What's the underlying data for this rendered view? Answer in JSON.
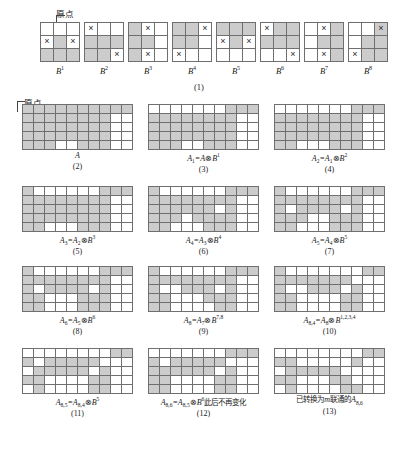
{
  "figure": {
    "origin_label": "原点",
    "section_caption_1": "(1)",
    "palette": {
      "filled": "#cccccc",
      "empty": "#ffffff",
      "border": "#6f6f6f",
      "mark": "#2a2a2a"
    },
    "marker_glyph": "×"
  },
  "structuring_elements": {
    "rows": 3,
    "cols": 3,
    "items": [
      {
        "name": "B",
        "sup": "1",
        "filled": [
          [
            0,
            0,
            0
          ],
          [
            0,
            1,
            0
          ],
          [
            1,
            1,
            1
          ]
        ],
        "marks": [
          [
            0,
            0,
            0
          ],
          [
            1,
            0,
            1
          ],
          [
            0,
            0,
            0
          ]
        ]
      },
      {
        "name": "B",
        "sup": "2",
        "filled": [
          [
            0,
            0,
            0
          ],
          [
            1,
            1,
            1
          ],
          [
            1,
            1,
            0
          ]
        ],
        "marks": [
          [
            1,
            0,
            0
          ],
          [
            0,
            0,
            0
          ],
          [
            0,
            0,
            1
          ]
        ]
      },
      {
        "name": "B",
        "sup": "3",
        "filled": [
          [
            1,
            0,
            0
          ],
          [
            1,
            1,
            0
          ],
          [
            1,
            0,
            0
          ]
        ],
        "marks": [
          [
            0,
            1,
            0
          ],
          [
            0,
            0,
            0
          ],
          [
            0,
            1,
            0
          ]
        ]
      },
      {
        "name": "B",
        "sup": "4",
        "filled": [
          [
            1,
            1,
            0
          ],
          [
            1,
            1,
            0
          ],
          [
            0,
            0,
            0
          ]
        ],
        "marks": [
          [
            0,
            0,
            1
          ],
          [
            0,
            0,
            0
          ],
          [
            1,
            0,
            0
          ]
        ]
      },
      {
        "name": "B",
        "sup": "5",
        "filled": [
          [
            1,
            1,
            1
          ],
          [
            0,
            1,
            0
          ],
          [
            0,
            0,
            0
          ]
        ],
        "marks": [
          [
            0,
            0,
            0
          ],
          [
            1,
            0,
            1
          ],
          [
            0,
            0,
            0
          ]
        ]
      },
      {
        "name": "B",
        "sup": "6",
        "filled": [
          [
            0,
            1,
            1
          ],
          [
            1,
            1,
            1
          ],
          [
            0,
            0,
            0
          ]
        ],
        "marks": [
          [
            1,
            0,
            0
          ],
          [
            0,
            0,
            0
          ],
          [
            0,
            0,
            1
          ]
        ]
      },
      {
        "name": "B",
        "sup": "7",
        "filled": [
          [
            0,
            0,
            1
          ],
          [
            0,
            1,
            1
          ],
          [
            0,
            0,
            1
          ]
        ],
        "marks": [
          [
            0,
            1,
            0
          ],
          [
            0,
            0,
            0
          ],
          [
            0,
            1,
            0
          ]
        ]
      },
      {
        "name": "B",
        "sup": "8",
        "filled": [
          [
            0,
            0,
            1
          ],
          [
            0,
            1,
            1
          ],
          [
            0,
            1,
            1
          ]
        ],
        "marks": [
          [
            0,
            0,
            1
          ],
          [
            0,
            0,
            0
          ],
          [
            1,
            0,
            0
          ]
        ]
      }
    ]
  },
  "matrix_panels": {
    "rows": 5,
    "cols": 10,
    "panels": [
      {
        "id": "A",
        "number": "(2)",
        "caption_html": "A",
        "grid": [
          [
            1,
            1,
            1,
            1,
            1,
            1,
            1,
            1,
            1,
            1
          ],
          [
            1,
            1,
            1,
            1,
            1,
            1,
            1,
            1,
            0,
            0
          ],
          [
            1,
            1,
            1,
            1,
            1,
            1,
            1,
            1,
            0,
            0
          ],
          [
            1,
            1,
            1,
            1,
            1,
            1,
            1,
            1,
            0,
            0
          ],
          [
            1,
            1,
            1,
            0,
            0,
            1,
            1,
            1,
            0,
            0
          ]
        ]
      },
      {
        "id": "A1",
        "number": "(3)",
        "caption_html": "A<sub>1</sub>=A<span class=\"op\">⊗</span>B<sup>1</sup>",
        "grid": [
          [
            0,
            0,
            0,
            0,
            0,
            0,
            0,
            1,
            1,
            1
          ],
          [
            1,
            1,
            1,
            1,
            1,
            1,
            1,
            1,
            0,
            0
          ],
          [
            1,
            1,
            1,
            1,
            1,
            1,
            1,
            1,
            0,
            0
          ],
          [
            1,
            1,
            1,
            1,
            1,
            1,
            1,
            1,
            0,
            0
          ],
          [
            1,
            1,
            1,
            0,
            0,
            1,
            1,
            1,
            0,
            0
          ]
        ]
      },
      {
        "id": "A2",
        "number": "(4)",
        "caption_html": "A<sub>2</sub>=A<sub>1</sub><span class=\"op\">⊗</span>B<sup>2</sup>",
        "grid": [
          [
            0,
            0,
            0,
            0,
            0,
            0,
            0,
            1,
            1,
            1
          ],
          [
            1,
            1,
            1,
            1,
            1,
            1,
            1,
            1,
            0,
            0
          ],
          [
            1,
            1,
            1,
            1,
            1,
            1,
            1,
            1,
            0,
            0
          ],
          [
            1,
            1,
            1,
            1,
            1,
            1,
            1,
            1,
            0,
            0
          ],
          [
            1,
            1,
            0,
            0,
            0,
            1,
            1,
            1,
            0,
            0
          ]
        ]
      },
      {
        "id": "A3",
        "number": "(5)",
        "caption_html": "A<sub>3</sub>=A<sub>2</sub><span class=\"op\">⊗</span>B<sup>3</sup>",
        "grid": [
          [
            1,
            0,
            0,
            0,
            0,
            0,
            0,
            1,
            1,
            1
          ],
          [
            1,
            1,
            1,
            1,
            1,
            1,
            1,
            1,
            0,
            0
          ],
          [
            1,
            1,
            1,
            1,
            1,
            1,
            1,
            1,
            0,
            0
          ],
          [
            1,
            1,
            1,
            1,
            1,
            1,
            1,
            1,
            0,
            0
          ],
          [
            1,
            1,
            0,
            0,
            0,
            1,
            1,
            1,
            0,
            0
          ]
        ]
      },
      {
        "id": "A4",
        "number": "(6)",
        "caption_html": "A<sub>4</sub>=A<sub>3</sub><span class=\"op\">⊗</span>B<sup>4</sup>",
        "grid": [
          [
            1,
            0,
            0,
            0,
            0,
            0,
            0,
            1,
            1,
            1
          ],
          [
            1,
            1,
            1,
            1,
            1,
            1,
            1,
            1,
            0,
            0
          ],
          [
            1,
            1,
            1,
            1,
            1,
            1,
            0,
            1,
            0,
            0
          ],
          [
            1,
            1,
            1,
            0,
            1,
            1,
            1,
            1,
            0,
            0
          ],
          [
            1,
            1,
            0,
            0,
            0,
            1,
            1,
            1,
            0,
            0
          ]
        ]
      },
      {
        "id": "A5",
        "number": "(7)",
        "caption_html": "A<sub>5</sub>=A<sub>4</sub><span class=\"op\">⊗</span>B<sup>5</sup>",
        "grid": [
          [
            1,
            0,
            0,
            0,
            0,
            0,
            0,
            1,
            1,
            1
          ],
          [
            1,
            1,
            1,
            1,
            1,
            1,
            1,
            1,
            0,
            0
          ],
          [
            1,
            0,
            1,
            1,
            1,
            1,
            0,
            1,
            0,
            0
          ],
          [
            1,
            1,
            1,
            0,
            0,
            1,
            1,
            1,
            0,
            0
          ],
          [
            1,
            1,
            0,
            0,
            0,
            1,
            1,
            1,
            0,
            0
          ]
        ]
      },
      {
        "id": "A6",
        "number": "(8)",
        "caption_html": "A<sub>6</sub>=A<sub>5</sub><span class=\"op\">⊗</span>B<sup>6</sup>",
        "grid": [
          [
            1,
            0,
            0,
            0,
            0,
            0,
            0,
            1,
            1,
            1
          ],
          [
            1,
            1,
            1,
            1,
            1,
            1,
            1,
            1,
            0,
            0
          ],
          [
            1,
            0,
            1,
            1,
            1,
            1,
            0,
            1,
            0,
            0
          ],
          [
            1,
            1,
            0,
            0,
            0,
            1,
            1,
            1,
            0,
            0
          ],
          [
            1,
            1,
            0,
            0,
            0,
            1,
            1,
            1,
            0,
            0
          ]
        ]
      },
      {
        "id": "A8",
        "number": "(9)",
        "caption_html": "A<sub>8</sub>=A<sub>7</sub><span class=\"op\">⊗</span>B<sup>7,8</sup>",
        "grid": [
          [
            1,
            0,
            0,
            0,
            0,
            0,
            0,
            1,
            1,
            1
          ],
          [
            1,
            1,
            1,
            1,
            1,
            1,
            1,
            1,
            0,
            0
          ],
          [
            1,
            0,
            0,
            1,
            1,
            1,
            0,
            1,
            0,
            0
          ],
          [
            1,
            1,
            0,
            0,
            0,
            1,
            1,
            1,
            0,
            0
          ],
          [
            1,
            1,
            0,
            0,
            0,
            0,
            1,
            1,
            0,
            0
          ]
        ]
      },
      {
        "id": "A84",
        "number": "(10)",
        "caption_html": "A<sub>8,4</sub>=A<sub>8</sub><span class=\"op\">⊗</span>B<sup>1,2,3,4</sup>",
        "grid": [
          [
            1,
            0,
            0,
            0,
            0,
            0,
            0,
            0,
            1,
            1
          ],
          [
            1,
            1,
            1,
            1,
            1,
            1,
            1,
            0,
            0,
            0
          ],
          [
            1,
            0,
            0,
            1,
            1,
            1,
            0,
            1,
            0,
            0
          ],
          [
            1,
            1,
            0,
            0,
            0,
            0,
            1,
            1,
            0,
            0
          ],
          [
            1,
            1,
            0,
            0,
            0,
            0,
            1,
            1,
            0,
            0
          ]
        ]
      },
      {
        "id": "A85",
        "number": "(11)",
        "caption_html": "A<sub>8,5</sub>=A<sub>8,4</sub><span class=\"op\">⊗</span>B<sup>5</sup>",
        "grid": [
          [
            0,
            0,
            0,
            0,
            0,
            0,
            0,
            0,
            1,
            1
          ],
          [
            1,
            0,
            1,
            1,
            1,
            1,
            1,
            0,
            0,
            0
          ],
          [
            0,
            1,
            1,
            1,
            1,
            1,
            0,
            1,
            0,
            0
          ],
          [
            1,
            1,
            0,
            0,
            0,
            0,
            1,
            1,
            0,
            0
          ],
          [
            0,
            1,
            0,
            0,
            0,
            0,
            1,
            1,
            0,
            0
          ]
        ]
      },
      {
        "id": "A86",
        "number": "(12)",
        "caption_html": "A<sub>8,6</sub>=A<sub>8,5</sub><span class=\"op\">⊗</span>B<sup>6</sup><span class=\"cn\">此后不再变化</span>",
        "grid": [
          [
            0,
            0,
            0,
            0,
            0,
            0,
            0,
            1,
            1,
            1
          ],
          [
            1,
            0,
            1,
            1,
            1,
            1,
            1,
            0,
            0,
            0
          ],
          [
            1,
            1,
            1,
            1,
            1,
            1,
            0,
            1,
            0,
            0
          ],
          [
            1,
            1,
            0,
            0,
            0,
            0,
            1,
            1,
            0,
            0
          ],
          [
            1,
            1,
            0,
            0,
            0,
            0,
            1,
            1,
            0,
            0
          ]
        ]
      },
      {
        "id": "A86final",
        "number": "(13)",
        "caption_html": "<span class=\"cn\">已转换为</span><i>m</i><span class=\"cn\">联通的</span><i>A</i><sub>8,6</sub>",
        "grid": [
          [
            0,
            0,
            0,
            0,
            0,
            0,
            0,
            0,
            1,
            1
          ],
          [
            1,
            1,
            0,
            0,
            0,
            0,
            0,
            1,
            0,
            0
          ],
          [
            0,
            1,
            1,
            1,
            1,
            1,
            0,
            0,
            0,
            0
          ],
          [
            1,
            1,
            0,
            0,
            0,
            1,
            1,
            0,
            0,
            0
          ],
          [
            0,
            1,
            0,
            0,
            0,
            0,
            1,
            1,
            0,
            0
          ]
        ]
      }
    ]
  }
}
